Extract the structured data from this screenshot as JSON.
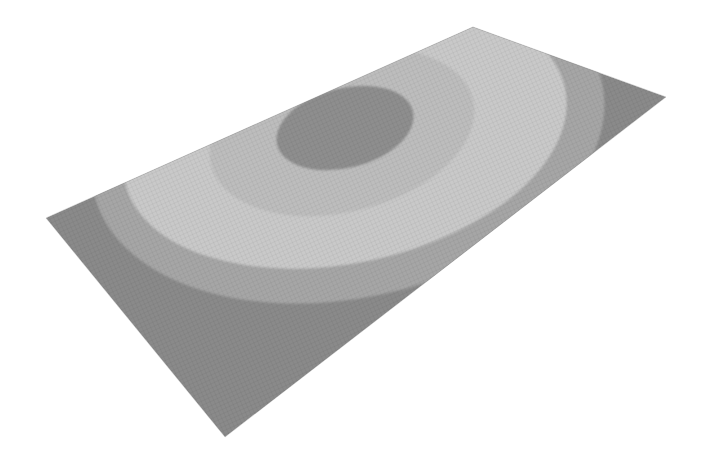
{
  "scene": {
    "description": "3D rendered meshed rectangular plate with concentric contour bands",
    "background_color": "#ffffff",
    "plate": {
      "corners": {
        "left": [
          46,
          218
        ],
        "top": [
          473,
          27
        ],
        "right": [
          666,
          97
        ],
        "bottom": [
          225,
          437
        ]
      },
      "mesh_visible": true
    },
    "contour_bands": [
      {
        "name": "outer",
        "color": "#8a8a8a"
      },
      {
        "name": "band-2",
        "color": "#a6a6a6"
      },
      {
        "name": "band-3",
        "color": "#c9c9c9"
      },
      {
        "name": "band-4",
        "color": "#bdbdbd"
      },
      {
        "name": "center",
        "color": "#8e8e8e"
      }
    ]
  }
}
